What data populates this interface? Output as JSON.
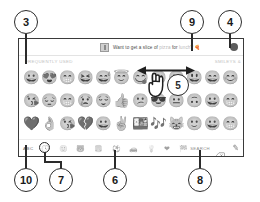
{
  "figure": {
    "callouts": [
      {
        "number": "3",
        "target": "frequently-used-section-label"
      },
      {
        "number": "4",
        "target": "send-button"
      },
      {
        "number": "5",
        "target": "swipe-gesture"
      },
      {
        "number": "6",
        "target": "category-bar"
      },
      {
        "number": "7",
        "target": "frequently-used-category-icon"
      },
      {
        "number": "8",
        "target": "backspace-key"
      },
      {
        "number": "9",
        "target": "message-banner-text"
      },
      {
        "number": "10",
        "target": "abc-key"
      }
    ]
  },
  "banner": {
    "avatar_icon": "contact-avatar-icon",
    "text_before": "Want to get a slice of ",
    "link_word": "pizza",
    "text_middle": " for ",
    "link_word2": "lunch",
    "text_after": "?",
    "trailing_emoji": "🍕",
    "send_icon": "send-button-icon"
  },
  "sections": {
    "left_label": "FREQUENTLY USED",
    "right_label": "SMILEYS &"
  },
  "emoji_grid": {
    "rows": [
      [
        "😀",
        "😍",
        "😁",
        "😆",
        "😅",
        "😇",
        "😋",
        "😉",
        "🙂",
        "😃",
        "😄",
        "😊"
      ],
      [
        "😘",
        "😔",
        "😁",
        "😢",
        "😌",
        "👍",
        "😕",
        "😎",
        "😐",
        "🙃",
        "😀",
        "😁"
      ],
      [
        "💜",
        "👌",
        "😘",
        "💔",
        "😀",
        "✌️",
        "🍱",
        "🎶",
        "😸",
        "🙂",
        "😀",
        "😁"
      ]
    ]
  },
  "toolbar": {
    "abc_label": "ABC",
    "categories": [
      {
        "icon": "🕓",
        "name": "frequently-used-icon",
        "active": true
      },
      {
        "icon": "🙂",
        "name": "smileys-icon",
        "active": false
      },
      {
        "icon": "🐻",
        "name": "animals-icon",
        "active": false
      },
      {
        "icon": "🍔",
        "name": "food-icon",
        "active": false
      },
      {
        "icon": "⚽",
        "name": "activity-icon",
        "active": false
      },
      {
        "icon": "🚗",
        "name": "travel-icon",
        "active": false
      },
      {
        "icon": "💡",
        "name": "objects-icon",
        "active": false
      },
      {
        "icon": "❤",
        "name": "symbols-icon",
        "active": false
      },
      {
        "icon": "🏁",
        "name": "flags-icon",
        "active": false
      }
    ],
    "search_label": "SEARCH",
    "backspace_icon": "backspace-icon",
    "pen_icon": "stylus-pen-icon"
  }
}
